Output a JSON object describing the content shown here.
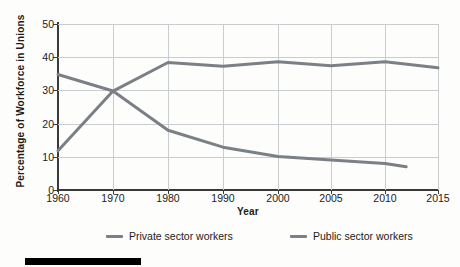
{
  "chart_data": {
    "type": "line",
    "title": "",
    "xlabel": "Year",
    "ylabel": "Percentage of Workforce in Unions",
    "xticklabels": [
      "1960",
      "1970",
      "1980",
      "1990",
      "2000",
      "2005",
      "2010",
      "2015"
    ],
    "yticklabels": [
      "0",
      "10",
      "20",
      "30",
      "40",
      "50"
    ],
    "ylim": [
      0,
      50
    ],
    "xlim": [
      1960,
      2015
    ],
    "grid": "both",
    "legend_position": "bottom",
    "line_color": "#7b8086",
    "series": [
      {
        "name": "Private sector workers",
        "x": [
          1960,
          1970,
          1980,
          1990,
          2000,
          2005,
          2010,
          2012
        ],
        "values": [
          34.8,
          29.8,
          18.0,
          12.9,
          10.1,
          9.0,
          8.0,
          7.0
        ]
      },
      {
        "name": "Public sector workers",
        "x": [
          1960,
          1970,
          1980,
          1990,
          2000,
          2005,
          2010,
          2015
        ],
        "values": [
          11.8,
          29.8,
          38.4,
          37.3,
          38.6,
          37.4,
          38.6,
          36.8
        ]
      }
    ],
    "legend": [
      {
        "label": "Private sector workers",
        "color": "#7b8086"
      },
      {
        "label": "Public sector workers",
        "color": "#7b8086"
      }
    ]
  }
}
